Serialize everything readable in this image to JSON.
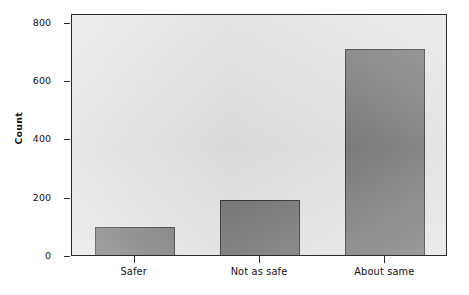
{
  "chart_data": {
    "type": "bar",
    "title": "",
    "subtitle": "",
    "xlabel": "",
    "ylabel": "Count",
    "categories": [
      "Safer",
      "Not as safe",
      "About same"
    ],
    "values": [
      97,
      190,
      707
    ],
    "series": [
      {
        "name": "Count",
        "values": [
          97,
          190,
          707
        ]
      }
    ],
    "ylim": [
      0,
      830
    ],
    "yticks": [
      0,
      200,
      400,
      600,
      800
    ],
    "ytick_labels": [
      "0",
      "200",
      "400",
      "600",
      "800"
    ],
    "grid": false,
    "legend": false,
    "legend_position": "none",
    "orientation": "vertical",
    "colors": {
      "bar_fill": "#6e6e6e",
      "bar_edge": "#262626",
      "plot_background": "#e2e2e2",
      "panel_border": "#2b2b2b",
      "figure_background": "#ffffff",
      "text": "#111111"
    },
    "annotations": []
  }
}
